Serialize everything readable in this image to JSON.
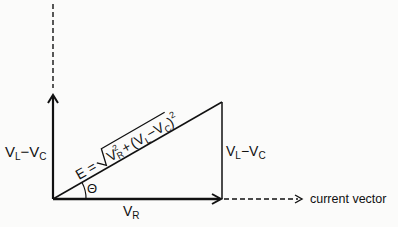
{
  "diagram": {
    "colors": {
      "ink": "#111111",
      "background": "#fbfbfa"
    },
    "nodes": {
      "origin": {
        "x": 53,
        "y": 199
      },
      "bottom_right": {
        "x": 222,
        "y": 199
      },
      "apex": {
        "x": 222,
        "y": 102
      }
    },
    "labels": {
      "left_vertical": {
        "main": "V",
        "sub1": "L",
        "dash": "−V",
        "sub2": "C"
      },
      "right_vertical": {
        "main": "V",
        "sub1": "L",
        "dash": "−V",
        "sub2": "C"
      },
      "horizontal": {
        "main": "V",
        "sub": "R"
      },
      "angle": "Θ",
      "hypotenuse_formula": {
        "lhs": "E =",
        "radical": "√",
        "term1": "V",
        "term1_sup": "2",
        "term1_sub": "R",
        "plus": "+",
        "term2": "(V",
        "term2_sub1": "L",
        "term2_mid": "−V",
        "term2_sub2": "C",
        "term2_close": ")",
        "term2_sup": "2"
      },
      "current_vector": "current vector"
    }
  }
}
